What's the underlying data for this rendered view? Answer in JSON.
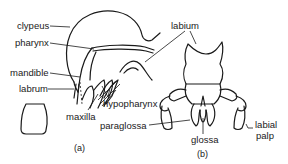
{
  "figure": {
    "panel_a": {
      "caption": "(a)",
      "labels": {
        "clypeus": "clypeus",
        "pharynx": "pharynx",
        "mandible": "mandible",
        "labrum": "labrum",
        "maxilla": "maxilla",
        "hypopharynx": "hypopharynx"
      }
    },
    "panel_b": {
      "caption": "(b)",
      "labels": {
        "labium": "labium",
        "paraglossa": "paraglossa",
        "glossa": "glossa",
        "labial_palp_line1": "labial",
        "labial_palp_line2": "palp"
      }
    },
    "colors": {
      "ink": "#1a1a1a",
      "background": "#ffffff"
    }
  }
}
